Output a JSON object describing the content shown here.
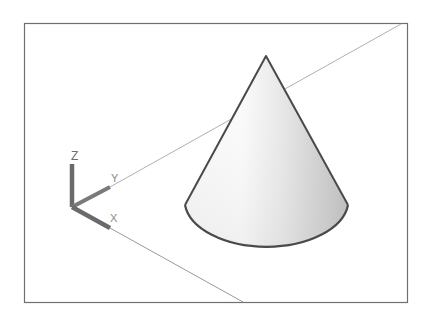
{
  "scene": {
    "type": "3d-wireframe-viewport",
    "object": "cone",
    "shading": "gouraud-gray"
  },
  "ucs_icon": {
    "labels": {
      "x": "X",
      "y": "Y",
      "z": "Z"
    }
  },
  "colors": {
    "background": "#ffffff",
    "frame": "#6f6f6f",
    "grid_line": "#b5b5b5",
    "cone_edge": "#4a4a4a",
    "cone_light": "#ffffff",
    "cone_dark": "#bdbdbd",
    "ucs_axis": "#6a6a6a"
  }
}
